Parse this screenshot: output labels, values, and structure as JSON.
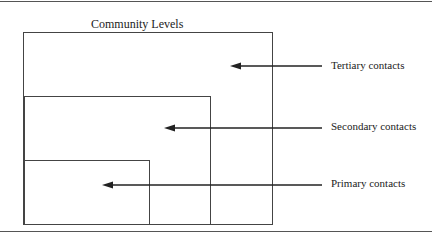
{
  "diagram": {
    "title": "Community Levels",
    "levels": [
      {
        "name": "tertiary",
        "label": "Tertiary contacts"
      },
      {
        "name": "secondary",
        "label": "Secondary contacts"
      },
      {
        "name": "primary",
        "label": "Primary contacts"
      }
    ]
  }
}
